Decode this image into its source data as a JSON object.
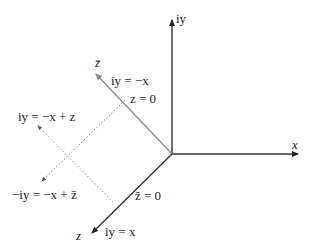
{
  "diagram": {
    "axes": {
      "vertical_label": "iy",
      "horizontal_label": "x",
      "gray_axis_label": "z̄",
      "dark_axis_label": "z"
    },
    "annotations": {
      "gray_line_top": "iy = −x",
      "gray_line_bottom": "z = 0",
      "dark_line_top": "z̄ = 0",
      "dark_line_bottom": "iy = x",
      "dotted_upper": "iy = −x + z",
      "dotted_lower": "−iy = −x + z̄"
    },
    "colors": {
      "axes": "#333333",
      "gray_axis": "#8a8a8a",
      "dotted": "#888888"
    }
  }
}
